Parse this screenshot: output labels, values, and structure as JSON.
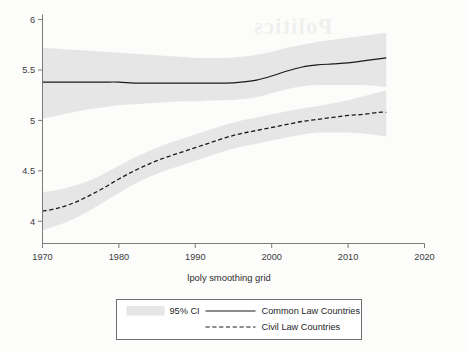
{
  "chart_data": {
    "type": "line",
    "title": "",
    "xlabel": "lpoly smoothing grid",
    "ylabel": "",
    "xlim": [
      1970,
      2020
    ],
    "ylim": [
      3.78,
      6.05
    ],
    "xticks": [
      1970,
      1980,
      1990,
      2000,
      2010,
      2020
    ],
    "yticks": [
      4,
      4.5,
      5,
      5.5,
      6
    ],
    "xtick_labels": [
      "1970",
      "1980",
      "1990",
      "2000",
      "2010",
      "2020"
    ],
    "ytick_labels": [
      "4",
      "4.5",
      "5",
      "5.5",
      "6"
    ],
    "grid": false,
    "legend_position": "bottom",
    "band_color": "#e6e6e6",
    "line_color": "#1a1a1a",
    "series": [
      {
        "name": "Common Law Countries",
        "style": "solid",
        "x": [
          1970,
          1972,
          1974,
          1976,
          1978,
          1980,
          1982,
          1984,
          1986,
          1988,
          1990,
          1992,
          1994,
          1996,
          1998,
          2000,
          2002,
          2004,
          2006,
          2008,
          2010,
          2012,
          2014,
          2015
        ],
        "values": [
          5.38,
          5.38,
          5.38,
          5.38,
          5.38,
          5.38,
          5.37,
          5.37,
          5.37,
          5.37,
          5.37,
          5.37,
          5.37,
          5.38,
          5.4,
          5.44,
          5.49,
          5.53,
          5.55,
          5.56,
          5.57,
          5.59,
          5.61,
          5.62
        ],
        "ci_lower": [
          5.02,
          5.05,
          5.08,
          5.11,
          5.13,
          5.15,
          5.16,
          5.17,
          5.18,
          5.19,
          5.19,
          5.2,
          5.2,
          5.21,
          5.23,
          5.27,
          5.31,
          5.34,
          5.35,
          5.35,
          5.35,
          5.35,
          5.34,
          5.33
        ],
        "ci_upper": [
          5.72,
          5.71,
          5.7,
          5.69,
          5.68,
          5.67,
          5.66,
          5.65,
          5.64,
          5.63,
          5.62,
          5.62,
          5.62,
          5.63,
          5.65,
          5.68,
          5.72,
          5.75,
          5.78,
          5.8,
          5.82,
          5.84,
          5.86,
          5.87
        ]
      },
      {
        "name": "Civil Law Countries",
        "style": "dashed",
        "x": [
          1970,
          1972,
          1974,
          1976,
          1978,
          1980,
          1982,
          1984,
          1986,
          1988,
          1990,
          1992,
          1994,
          1996,
          1998,
          2000,
          2002,
          2004,
          2006,
          2008,
          2010,
          2012,
          2014,
          2015
        ],
        "values": [
          4.1,
          4.13,
          4.18,
          4.25,
          4.33,
          4.42,
          4.5,
          4.57,
          4.63,
          4.68,
          4.73,
          4.78,
          4.83,
          4.87,
          4.9,
          4.93,
          4.96,
          4.99,
          5.01,
          5.03,
          5.05,
          5.06,
          5.08,
          5.08
        ],
        "ci_lower": [
          3.91,
          3.96,
          4.02,
          4.1,
          4.19,
          4.28,
          4.37,
          4.44,
          4.5,
          4.55,
          4.6,
          4.65,
          4.7,
          4.74,
          4.77,
          4.8,
          4.83,
          4.86,
          4.88,
          4.88,
          4.88,
          4.87,
          4.85,
          4.84
        ],
        "ci_upper": [
          4.29,
          4.31,
          4.35,
          4.4,
          4.47,
          4.55,
          4.63,
          4.7,
          4.76,
          4.81,
          4.86,
          4.91,
          4.96,
          5.0,
          5.03,
          5.06,
          5.09,
          5.12,
          5.14,
          5.17,
          5.2,
          5.24,
          5.28,
          5.3
        ]
      }
    ]
  },
  "legend": {
    "ci_label": "95% CI",
    "common_law_label": "Common Law Countries",
    "civil_law_label": "Civil Law Countries"
  },
  "axis": {
    "xlabel": "lpoly smoothing grid"
  },
  "watermark": {
    "line1": "Politics",
    "line2": "comparative perspective"
  }
}
